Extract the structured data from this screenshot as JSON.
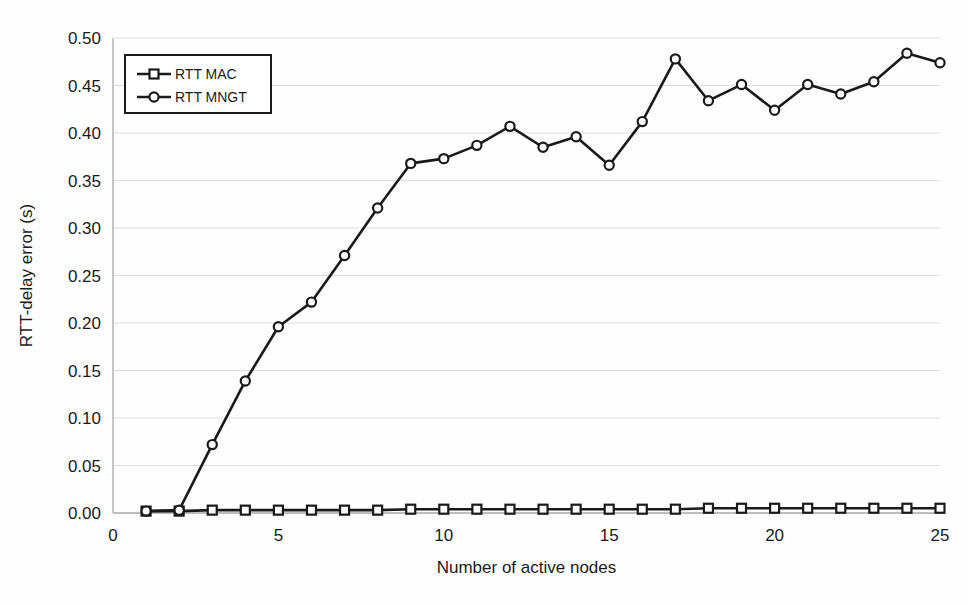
{
  "chart_data": {
    "type": "line",
    "title": "",
    "xlabel": "Number of active nodes",
    "ylabel": "RTT-delay error (s)",
    "xlim": [
      0,
      25
    ],
    "ylim": [
      0.0,
      0.5
    ],
    "xticks": [
      0,
      5,
      10,
      15,
      20,
      25
    ],
    "xtick_labels": [
      "0",
      "5",
      "10",
      "15",
      "20",
      "25"
    ],
    "yticks": [
      0.0,
      0.05,
      0.1,
      0.15,
      0.2,
      0.25,
      0.3,
      0.35,
      0.4,
      0.45,
      0.5
    ],
    "ytick_labels": [
      "0.00",
      "0.05",
      "0.10",
      "0.15",
      "0.20",
      "0.25",
      "0.30",
      "0.35",
      "0.40",
      "0.45",
      "0.50"
    ],
    "grid": true,
    "grid_axis": "y",
    "legend_position": "upper left",
    "x": [
      1,
      2,
      3,
      4,
      5,
      6,
      7,
      8,
      9,
      10,
      11,
      12,
      13,
      14,
      15,
      16,
      17,
      18,
      19,
      20,
      21,
      22,
      23,
      24,
      25
    ],
    "series": [
      {
        "name": "RTT MAC",
        "marker": "square",
        "color": "#1a1a1a",
        "values": [
          0.002,
          0.002,
          0.003,
          0.003,
          0.003,
          0.003,
          0.003,
          0.003,
          0.004,
          0.004,
          0.004,
          0.004,
          0.004,
          0.004,
          0.004,
          0.004,
          0.004,
          0.005,
          0.005,
          0.005,
          0.005,
          0.005,
          0.005,
          0.005,
          0.005
        ]
      },
      {
        "name": "RTT MNGT",
        "marker": "circle",
        "color": "#1a1a1a",
        "values": [
          0.002,
          0.003,
          0.072,
          0.139,
          0.196,
          0.222,
          0.271,
          0.321,
          0.368,
          0.373,
          0.387,
          0.407,
          0.385,
          0.396,
          0.366,
          0.412,
          0.478,
          0.434,
          0.451,
          0.424,
          0.451,
          0.441,
          0.454,
          0.484,
          0.474
        ]
      }
    ]
  },
  "legend": {
    "entries": [
      {
        "label": "RTT MAC",
        "marker": "square"
      },
      {
        "label": "RTT MNGT",
        "marker": "circle"
      }
    ]
  },
  "colors": {
    "line": "#1a1a1a",
    "grid": "#d9dde4",
    "axis": "#a8a8a8",
    "background": "#fefefe",
    "marker_fill": "#ffffff"
  }
}
